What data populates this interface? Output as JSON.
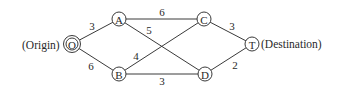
{
  "diagram": {
    "type": "weighted-network",
    "labels": {
      "origin": "(Origin)",
      "destination": "(Destination)"
    },
    "nodes": [
      {
        "id": "O",
        "label": "O",
        "x": 72,
        "y": 44,
        "double": true
      },
      {
        "id": "A",
        "label": "A",
        "x": 119,
        "y": 19
      },
      {
        "id": "B",
        "label": "B",
        "x": 119,
        "y": 74
      },
      {
        "id": "C",
        "label": "C",
        "x": 204,
        "y": 19
      },
      {
        "id": "D",
        "label": "D",
        "x": 205,
        "y": 74
      },
      {
        "id": "T",
        "label": "T",
        "x": 252,
        "y": 44
      }
    ],
    "edges": [
      {
        "from": "O",
        "to": "A",
        "weight": "3",
        "lx": 92,
        "ly": 26
      },
      {
        "from": "O",
        "to": "B",
        "weight": "6",
        "lx": 91,
        "ly": 66
      },
      {
        "from": "A",
        "to": "C",
        "weight": "6",
        "lx": 162,
        "ly": 12
      },
      {
        "from": "A",
        "to": "D",
        "weight": "5",
        "lx": 149,
        "ly": 30
      },
      {
        "from": "B",
        "to": "C",
        "weight": "4",
        "lx": 136,
        "ly": 56
      },
      {
        "from": "B",
        "to": "D",
        "weight": "3",
        "lx": 162,
        "ly": 81
      },
      {
        "from": "C",
        "to": "T",
        "weight": "3",
        "lx": 232,
        "ly": 26
      },
      {
        "from": "D",
        "to": "T",
        "weight": "2",
        "lx": 235,
        "ly": 65
      }
    ]
  }
}
